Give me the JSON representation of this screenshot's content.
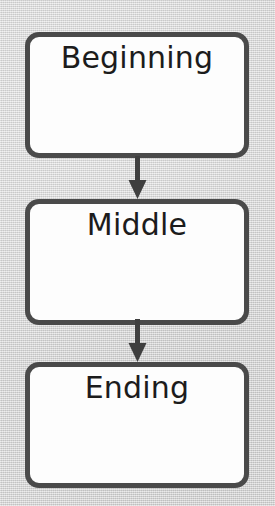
{
  "diagram": {
    "type": "flowchart",
    "orientation": "vertical",
    "background_color": "#d4d4d4",
    "node_fill_color": "#fdfdfd",
    "node_border_color": "#4a4a4a",
    "text_color": "#1c1c1c",
    "arrow_color": "#3f3f3f",
    "nodes": [
      {
        "id": "beginning",
        "label": "Beginning"
      },
      {
        "id": "middle",
        "label": "Middle"
      },
      {
        "id": "ending",
        "label": "Ending"
      }
    ],
    "connectors": [
      {
        "id": "beginning-to-middle",
        "from": "beginning",
        "to": "middle",
        "style": "solid-arrow",
        "direction": "down"
      },
      {
        "id": "middle-to-ending",
        "from": "middle",
        "to": "ending",
        "style": "solid-arrow",
        "direction": "down"
      }
    ]
  }
}
